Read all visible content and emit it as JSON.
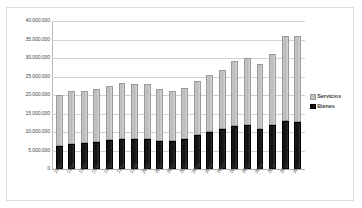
{
  "chart_data": {
    "type": "bar",
    "stacked": true,
    "title": "",
    "xlabel": "",
    "ylabel": "",
    "ylim": [
      0,
      40000000
    ],
    "ytick_step": 5000000,
    "grid": "horizontal",
    "legend_position": "right",
    "ytick_labels": [
      "40.000.000",
      "35.000.000",
      "30.000.000",
      "25.000.000",
      "20.000.000",
      "15.000.000",
      "10.000.000",
      "5.000.000",
      "0"
    ],
    "categories": [
      "1993",
      "1994",
      "1995",
      "1996",
      "1997",
      "1998",
      "1999",
      "2000",
      "2001",
      "2002",
      "2003",
      "2004",
      "2005",
      "2006",
      "2007",
      "2008",
      "2009",
      "2010",
      "2011",
      "2012"
    ],
    "series": [
      {
        "name": "Bienes",
        "color": "#141414",
        "values": [
          6200000,
          6800000,
          7000000,
          7300000,
          7900000,
          8200000,
          8000000,
          8100000,
          7600000,
          7500000,
          8000000,
          9200000,
          10100000,
          10700000,
          11600000,
          11800000,
          10900000,
          11900000,
          13100000,
          12800000
        ]
      },
      {
        "name": "Servicios",
        "color": "#bfbfbf",
        "values": [
          13800000,
          14200000,
          14000000,
          14200000,
          14600000,
          15000000,
          14900000,
          14900000,
          13900000,
          13600000,
          14000000,
          14700000,
          15300000,
          16000000,
          17500000,
          18200000,
          17400000,
          19100000,
          22900000,
          23200000
        ]
      }
    ],
    "totals": [
      20000000,
      21000000,
      21000000,
      21500000,
      22500000,
      23200000,
      22900000,
      23000000,
      21500000,
      21100000,
      22000000,
      23900000,
      25400000,
      26700000,
      29100000,
      30000000,
      28300000,
      31000000,
      36000000,
      36000000
    ]
  },
  "legend": {
    "items": [
      {
        "label": "Servicios"
      },
      {
        "label": "Bienes"
      }
    ]
  }
}
